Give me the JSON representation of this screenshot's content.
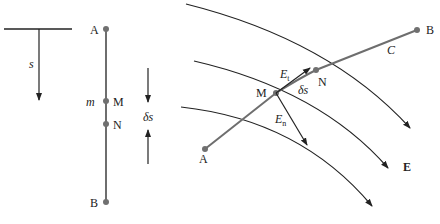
{
  "left_figure": {
    "s_label": "s",
    "point_A": "A",
    "point_M": "M",
    "mass_label": "m",
    "point_N": "N",
    "point_B": "B",
    "delta_s_label": "δs"
  },
  "right_figure": {
    "point_A": "A",
    "point_M": "M",
    "point_N": "N",
    "point_B": "B",
    "curve_label": "C",
    "field_label": "E",
    "Et_main": "E",
    "Et_sub": "t",
    "En_main": "E",
    "En_sub": "n",
    "delta_s_label": "δs"
  },
  "colors": {
    "line": "#222222",
    "path": "#6e6e6e",
    "point": "#707070"
  }
}
